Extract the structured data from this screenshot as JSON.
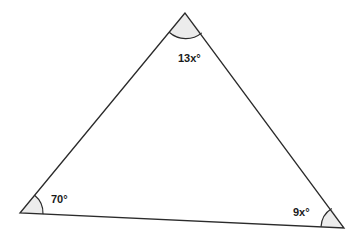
{
  "diagram": {
    "type": "triangle",
    "vertices": {
      "top": {
        "x": 185,
        "y": 13
      },
      "bottom_left": {
        "x": 20,
        "y": 213
      },
      "bottom_right": {
        "x": 344,
        "y": 228
      }
    },
    "angles": {
      "top": {
        "label": "13x°"
      },
      "bottom_left": {
        "label": "70°"
      },
      "bottom_right": {
        "label": "9x°"
      }
    },
    "colors": {
      "stroke": "#2b2b2b",
      "angle_fill": "#ececec",
      "text": "#1a1a1a",
      "background": "#ffffff"
    }
  }
}
